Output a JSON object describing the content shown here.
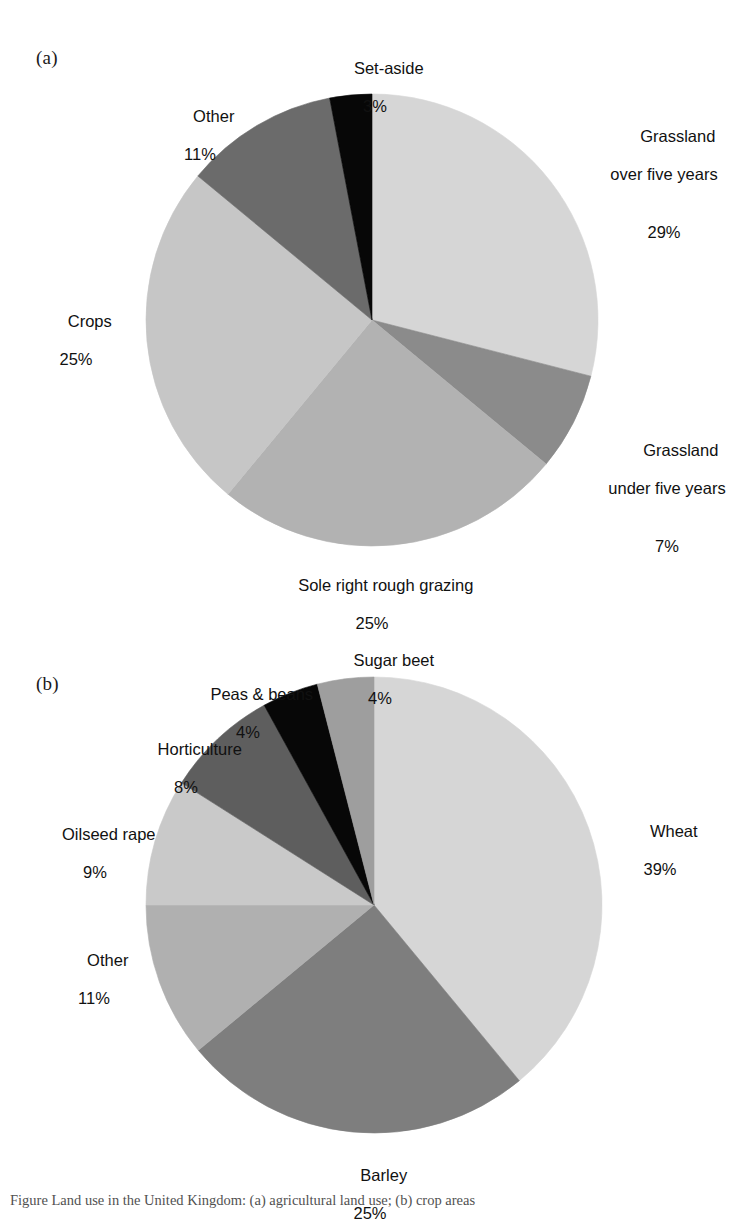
{
  "figure": {
    "caption": "Figure  Land use in the United Kingdom: (a) agricultural land use; (b) crop areas",
    "panels": [
      {
        "letter": "(a)"
      },
      {
        "letter": "(b)"
      }
    ]
  },
  "chart_data": [
    {
      "type": "pie",
      "panel": "(a)",
      "title": "",
      "start_angle_deg": 0,
      "direction": "clockwise",
      "units": "percent",
      "labels": [
        "Grassland over five years",
        "Grassland under five years",
        "Sole right rough grazing",
        "Crops",
        "Other",
        "Set-aside"
      ],
      "values": [
        29,
        7,
        25,
        25,
        11,
        3
      ],
      "value_labels": [
        "29%",
        "7%",
        "25%",
        "25%",
        "11%",
        "3%"
      ],
      "colors": [
        "#d6d6d6",
        "#8b8b8b",
        "#b2b2b2",
        "#c6c6c6",
        "#6b6b6b",
        "#070707"
      ],
      "slices": [
        {
          "label": "Grassland over five years",
          "label_line1": "Grassland",
          "label_line2": "over five years",
          "value": 29,
          "value_label": "29%",
          "color": "#d6d6d6"
        },
        {
          "label": "Grassland under five years",
          "label_line1": "Grassland",
          "label_line2": "under five years",
          "value": 7,
          "value_label": "7%",
          "color": "#8b8b8b"
        },
        {
          "label": "Sole right rough grazing",
          "label_line1": "Sole right rough grazing",
          "label_line2": "",
          "value": 25,
          "value_label": "25%",
          "color": "#b2b2b2"
        },
        {
          "label": "Crops",
          "label_line1": "Crops",
          "label_line2": "",
          "value": 25,
          "value_label": "25%",
          "color": "#c6c6c6"
        },
        {
          "label": "Other",
          "label_line1": "Other",
          "label_line2": "",
          "value": 11,
          "value_label": "11%",
          "color": "#6b6b6b"
        },
        {
          "label": "Set-aside",
          "label_line1": "Set-aside",
          "label_line2": "",
          "value": 3,
          "value_label": "3%",
          "color": "#070707"
        }
      ]
    },
    {
      "type": "pie",
      "panel": "(b)",
      "title": "",
      "start_angle_deg": 0,
      "direction": "clockwise",
      "units": "percent",
      "labels": [
        "Wheat",
        "Barley",
        "Other",
        "Oilseed rape",
        "Horticulture",
        "Peas & beans",
        "Sugar beet"
      ],
      "values": [
        39,
        25,
        11,
        9,
        8,
        4,
        4
      ],
      "value_labels": [
        "39%",
        "25%",
        "11%",
        "9%",
        "8%",
        "4%",
        "4%"
      ],
      "colors": [
        "#d6d6d6",
        "#7e7e7e",
        "#b0b0b0",
        "#c9c9c9",
        "#5e5e5e",
        "#070707",
        "#9e9e9e"
      ],
      "slices": [
        {
          "label": "Wheat",
          "label_line1": "Wheat",
          "label_line2": "",
          "value": 39,
          "value_label": "39%",
          "color": "#d6d6d6"
        },
        {
          "label": "Barley",
          "label_line1": "Barley",
          "label_line2": "",
          "value": 25,
          "value_label": "25%",
          "color": "#7e7e7e"
        },
        {
          "label": "Other",
          "label_line1": "Other",
          "label_line2": "",
          "value": 11,
          "value_label": "11%",
          "color": "#b0b0b0"
        },
        {
          "label": "Oilseed rape",
          "label_line1": "Oilseed rape",
          "label_line2": "",
          "value": 9,
          "value_label": "9%",
          "color": "#c9c9c9"
        },
        {
          "label": "Horticulture",
          "label_line1": "Horticulture",
          "label_line2": "",
          "value": 8,
          "value_label": "8%",
          "color": "#5e5e5e"
        },
        {
          "label": "Peas & beans",
          "label_line1": "Peas & beans",
          "label_line2": "",
          "value": 4,
          "value_label": "4%",
          "color": "#070707"
        },
        {
          "label": "Sugar beet",
          "label_line1": "Sugar beet",
          "label_line2": "",
          "value": 4,
          "value_label": "4%",
          "color": "#9e9e9e"
        }
      ]
    }
  ]
}
